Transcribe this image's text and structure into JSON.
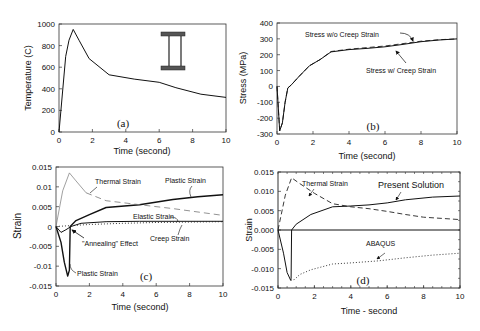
{
  "chart_data": [
    {
      "id": "a",
      "type": "line",
      "panel_label": "(a)",
      "xlabel": "Time (second)",
      "ylabel": "Temperature (C)",
      "xlim": [
        0,
        10
      ],
      "ylim": [
        0,
        1000
      ],
      "xticks": [
        0,
        2,
        4,
        6,
        8,
        10
      ],
      "yticks": [
        0,
        200,
        400,
        600,
        800,
        1000
      ],
      "inset_icon": "i-beam-cross-section",
      "series": [
        {
          "name": "Temperature",
          "style": "solid",
          "x": [
            0,
            0.4,
            0.6,
            0.85,
            1.2,
            1.8,
            3.0,
            4.5,
            6.0,
            7.0,
            8.5,
            10
          ],
          "y": [
            0,
            700,
            850,
            950,
            850,
            680,
            530,
            490,
            460,
            410,
            350,
            320
          ]
        }
      ]
    },
    {
      "id": "b",
      "type": "line",
      "panel_label": "(b)",
      "xlabel": "Time (second)",
      "ylabel": "Stress (MPa)",
      "xlim": [
        0,
        10
      ],
      "ylim": [
        -300,
        400
      ],
      "xticks": [
        0,
        2,
        4,
        6,
        8,
        10
      ],
      "yticks": [
        -300,
        -200,
        -100,
        0,
        100,
        200,
        300,
        400
      ],
      "annotations": [
        "Stress w/o Creep Strain",
        "Stress w/ Creep Strain"
      ],
      "series": [
        {
          "name": "Stress w/o Creep Strain",
          "style": "dashed",
          "x": [
            0,
            0.15,
            0.3,
            0.45,
            0.6,
            0.8,
            1.2,
            1.8,
            2.4,
            3.0,
            4.0,
            5.0,
            6.0,
            7.0,
            8.0,
            9.0,
            10
          ],
          "y": [
            0,
            -280,
            -230,
            -100,
            -10,
            10,
            60,
            130,
            170,
            220,
            235,
            245,
            255,
            270,
            285,
            295,
            300
          ]
        },
        {
          "name": "Stress w/ Creep Strain",
          "style": "solid",
          "x": [
            0,
            0.15,
            0.3,
            0.45,
            0.6,
            0.8,
            1.2,
            1.8,
            2.4,
            3.0,
            4.0,
            5.0,
            6.0,
            7.0,
            8.0,
            9.0,
            10
          ],
          "y": [
            0,
            -280,
            -230,
            -100,
            -10,
            10,
            60,
            130,
            170,
            218,
            232,
            240,
            250,
            265,
            282,
            293,
            300
          ]
        }
      ]
    },
    {
      "id": "c",
      "type": "line",
      "panel_label": "(c)",
      "xlabel": "Time (second)",
      "ylabel": "Strain",
      "xlim": [
        0,
        10
      ],
      "ylim": [
        -0.015,
        0.015
      ],
      "xticks": [
        0,
        2,
        4,
        6,
        8,
        10
      ],
      "yticks": [
        -0.015,
        -0.01,
        -0.005,
        0,
        0.005,
        0.01,
        0.015
      ],
      "ytick_labels": [
        "-0.015",
        "-0.01",
        "-0.005",
        "0",
        "0.005",
        "0.01",
        "0.015"
      ],
      "annotations": [
        "Thermal Strain",
        "Plastic Strain",
        "Elastic Strain",
        "Creep Strain",
        "\"Annealing\" Effect",
        "Plastic Strain"
      ],
      "series": [
        {
          "name": "Thermal Strain",
          "style": "thin-then-dashed",
          "x": [
            0,
            0.4,
            0.8,
            1.2,
            1.8,
            3.0,
            5.0,
            7.0,
            10
          ],
          "y": [
            0,
            0.009,
            0.0135,
            0.0115,
            0.0085,
            0.0065,
            0.0055,
            0.0045,
            0.0028
          ]
        },
        {
          "name": "Plastic Strain",
          "style": "solid-bold",
          "x": [
            0,
            0.3,
            0.5,
            0.7,
            0.8,
            0.85,
            1.2,
            2.0,
            3.0,
            5.0,
            7.0,
            8.5,
            10
          ],
          "y": [
            0,
            -0.004,
            -0.009,
            -0.0125,
            -0.011,
            0.0,
            0.0015,
            0.003,
            0.0048,
            0.0055,
            0.0068,
            0.0075,
            0.008
          ]
        },
        {
          "name": "Elastic Strain",
          "style": "solid",
          "x": [
            0,
            0.3,
            0.6,
            0.9,
            1.5,
            3.0,
            5.0,
            10
          ],
          "y": [
            0,
            -0.0015,
            -0.0008,
            0.0,
            0.0008,
            0.0012,
            0.0013,
            0.0013
          ]
        },
        {
          "name": "Creep Strain",
          "style": "dotted",
          "x": [
            0,
            2,
            4,
            6,
            8,
            10
          ],
          "y": [
            0,
            0.0005,
            0.0008,
            0.001,
            0.0011,
            0.0012
          ]
        }
      ]
    },
    {
      "id": "d",
      "type": "line",
      "panel_label": "(d)",
      "xlabel": "Time - second",
      "ylabel": "Strain",
      "xlim": [
        0,
        10
      ],
      "ylim": [
        -0.015,
        0.015
      ],
      "xticks": [
        0,
        2,
        4,
        6,
        8,
        10
      ],
      "yticks": [
        -0.015,
        -0.01,
        -0.005,
        0,
        0.005,
        0.01,
        0.015
      ],
      "ytick_labels": [
        "-0.015",
        "-0.010",
        "-0.005",
        "0.000",
        "0.005",
        "0.010",
        "0.015"
      ],
      "annotations": [
        "Thermal Strain",
        "Present Solution",
        "ABAQUS"
      ],
      "series": [
        {
          "name": "Thermal Strain",
          "style": "dashed",
          "x": [
            0,
            0.4,
            0.75,
            1.2,
            2.0,
            3.0,
            4.0,
            5.0,
            6.0,
            7.0,
            8.0,
            9.0,
            10
          ],
          "y": [
            0,
            0.009,
            0.0135,
            0.012,
            0.0095,
            0.0068,
            0.006,
            0.0055,
            0.0048,
            0.004,
            0.0033,
            0.003,
            0.0027
          ]
        },
        {
          "name": "Present Solution",
          "style": "solid",
          "x": [
            0,
            0.3,
            0.5,
            0.7,
            0.72,
            0.75,
            1.0,
            1.8,
            3.0,
            4.0,
            5.0,
            6.0,
            7.0,
            8.5,
            10
          ],
          "y": [
            0,
            -0.006,
            -0.011,
            -0.013,
            -0.0125,
            0.0,
            0.0015,
            0.004,
            0.006,
            0.0062,
            0.0065,
            0.007,
            0.0078,
            0.0085,
            0.0088
          ]
        },
        {
          "name": "ABAQUS",
          "style": "dotted",
          "x": [
            0.7,
            0.9,
            1.2,
            1.8,
            3.0,
            4.0,
            5.5,
            7.0,
            8.5,
            10
          ],
          "y": [
            -0.013,
            -0.0128,
            -0.0115,
            -0.0103,
            -0.0088,
            -0.0085,
            -0.008,
            -0.0072,
            -0.0065,
            -0.006
          ]
        }
      ]
    }
  ],
  "labels": {
    "a": {
      "tag": "(a)",
      "xlabel": "Time (second)",
      "ylabel": "Temperature (C)"
    },
    "b": {
      "tag": "(b)",
      "xlabel": "Time (second)",
      "ylabel": "Stress (MPa)",
      "ann_wo": "Stress w/o Creep Strain",
      "ann_w": "Stress w/ Creep Strain"
    },
    "c": {
      "tag": "(c)",
      "xlabel": "Time (second)",
      "ylabel": "Strain",
      "thermal": "Thermal Strain",
      "plastic_top": "Plastic Strain",
      "elastic": "Elastic Strain",
      "creep": "Creep Strain",
      "anneal": "\"Annealing\" Effect",
      "plastic_bottom": "Plastic Strain"
    },
    "d": {
      "tag": "(d)",
      "xlabel": "Time - second",
      "ylabel": "Strain",
      "thermal": "Thermal Strain",
      "present": "Present Solution",
      "abaqus": "ABAQUS"
    }
  }
}
